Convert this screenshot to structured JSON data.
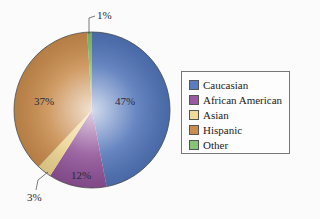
{
  "chart_data": {
    "type": "pie",
    "title": "",
    "categories": [
      "Caucasian",
      "African American",
      "Asian",
      "Hispanic",
      "Other"
    ],
    "values": [
      47,
      12,
      3,
      37,
      1
    ],
    "labels": [
      "47%",
      "12%",
      "3%",
      "37%",
      "1%"
    ],
    "colors": [
      "#4f73b8",
      "#8e4f96",
      "#ecd38e",
      "#c88a4a",
      "#7fbf6a"
    ],
    "legend_position": "right"
  },
  "legend": {
    "items": [
      {
        "label": "Caucasian",
        "color": "#5a7cc0"
      },
      {
        "label": "African American",
        "color": "#9a5aa0"
      },
      {
        "label": "Asian",
        "color": "#f0d99a"
      },
      {
        "label": "Hispanic",
        "color": "#c98d4f"
      },
      {
        "label": "Other",
        "color": "#86c278"
      }
    ]
  }
}
